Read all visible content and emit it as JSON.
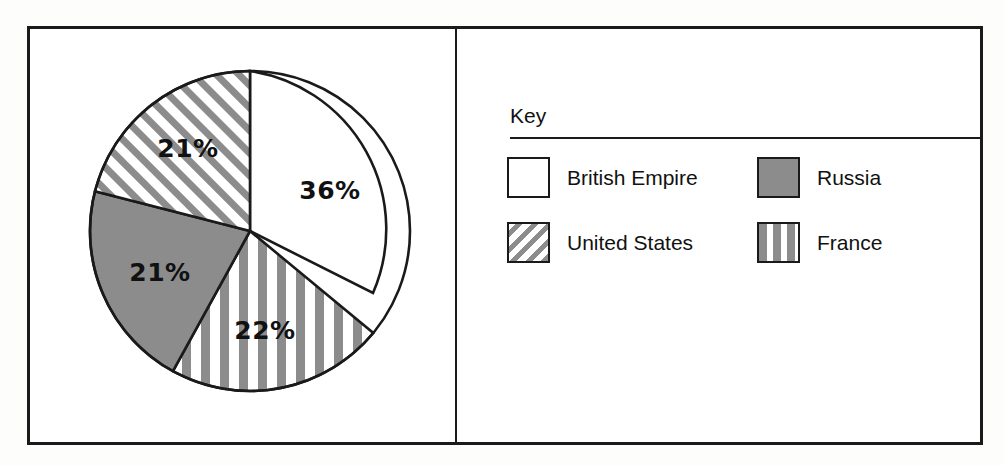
{
  "figure": {
    "key_title": "Key"
  },
  "chart_data": {
    "type": "pie",
    "title": "",
    "categories": [
      "British Empire",
      "France",
      "Russia",
      "United States"
    ],
    "values": [
      36,
      22,
      21,
      21
    ],
    "value_labels": [
      "36%",
      "22%",
      "21%",
      "21%"
    ],
    "unit": "%",
    "legend_position": "right",
    "grid": false,
    "start_angle_deg": 0,
    "direction": "clockwise",
    "slices": [
      {
        "name": "British Empire",
        "value": 36,
        "label": "36%",
        "pattern": "solid-white",
        "fill": "#ffffff",
        "start_deg": 0,
        "end_deg": 129.6,
        "label_x": 330,
        "label_y": 190
      },
      {
        "name": "France",
        "value": 22,
        "label": "22%",
        "pattern": "vertical-stripes",
        "fill": "#8c8c8c",
        "start_deg": 129.6,
        "end_deg": 208.8,
        "label_x": 265,
        "label_y": 330
      },
      {
        "name": "Russia",
        "value": 21,
        "label": "21%",
        "pattern": "solid-gray",
        "fill": "#8c8c8c",
        "start_deg": 208.8,
        "end_deg": 284.4,
        "label_x": 160,
        "label_y": 272
      },
      {
        "name": "United States",
        "value": 21,
        "label": "21%",
        "pattern": "diagonal-stripes",
        "fill": "#8c8c8c",
        "start_deg": 284.4,
        "end_deg": 360,
        "label_x": 188,
        "label_y": 148
      }
    ]
  },
  "legend": {
    "title": "Key",
    "entries": [
      {
        "label": "British Empire",
        "pattern": "solid-white"
      },
      {
        "label": "Russia",
        "pattern": "solid-gray"
      },
      {
        "label": "United States",
        "pattern": "diagonal-stripes"
      },
      {
        "label": "France",
        "pattern": "vertical-stripes"
      }
    ]
  },
  "colors": {
    "stroke": "#1a1a1a",
    "gray_fill": "#8c8c8c",
    "white_fill": "#ffffff"
  }
}
